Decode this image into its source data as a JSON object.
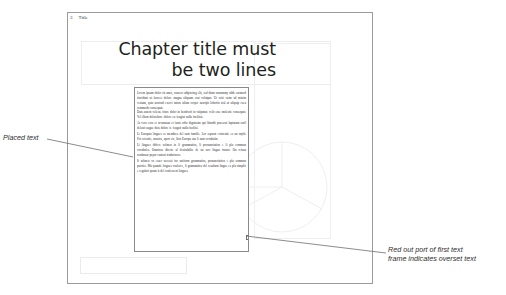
{
  "document": {
    "title_frame": {
      "text": "Chapter title must\nbe two lines"
    },
    "footer": {
      "page_number": "3",
      "label": "Title"
    },
    "body_frame": {
      "paragraphs": [
        "Lorem ipsum dolor sit amet, consect adipiscing elit, sed diam nonummy nibh euismod tincidunt ut laoreet dolore magna aliquam erat volutpat. Ut wisi enim ad minim veniam, quis nostrud exerci tation ullam corper suscipit lobortis nisl ut aliquip exea commodo consequat.",
        "Duis autem velesse iriure dolor in hendrerit in vulputate velit esse molestie consequat. Vel illum dolorebore dolore eu feugiat nulla facilisis.",
        "At vero eros et accumsan et iusto odio dignissim qui blandit praesent luptatum zzril delenit augue duis dolore te feugait nulla facilisi.",
        "Li Europan lingues es membres del sam familie. Lor separat existentie es un myth. Por scientie, musica, sport etc, litot Europa usa li sam vocabular.",
        "Li lingues differe solmen in li grammatica, li pronunciation e li plu commun vocabules. Omnicos directe al desirabilite de un nov lingua franco. On refusa continuar payar custosi traductores.",
        "It solmen va esser necessi far uniform grammatica, pronunciation e plu sommun paroles. Ma quande lingues coalesce, li grammatica del resultant lingue es plu simplic e regulari quam ti del coalescent lingues."
      ]
    }
  },
  "annotations": {
    "left": {
      "text": "Placed text"
    },
    "right": {
      "text": "Red out port of first text\nframe indicates overset text"
    }
  },
  "colors": {
    "page_border": "#9a9a9a",
    "frame_border": "#8a8a8a",
    "faint_border": "#ededed",
    "text": "#231f20",
    "leader_line": "#6e6e6e",
    "overset_red": "#c0392b"
  }
}
